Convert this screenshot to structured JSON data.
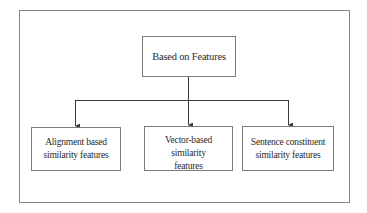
{
  "diagram": {
    "type": "tree",
    "root": {
      "label": "Based on Features"
    },
    "children": [
      {
        "line1": "Alignment based",
        "line2": "similarity features"
      },
      {
        "line1": "Vector-based similarity",
        "line2": "features"
      },
      {
        "line1": "Sentence constituent",
        "line2": "similarity features"
      }
    ],
    "edges": [
      {
        "from": "Based on Features",
        "to": "Alignment based similarity features"
      },
      {
        "from": "Based on Features",
        "to": "Vector-based similarity features"
      },
      {
        "from": "Based on Features",
        "to": "Sentence constituent similarity features"
      }
    ],
    "colors": {
      "line": "#3a3a3a",
      "box_border": "#7a7a7a",
      "frame_border": "#8a8a8a",
      "background": "#ffffff"
    }
  }
}
